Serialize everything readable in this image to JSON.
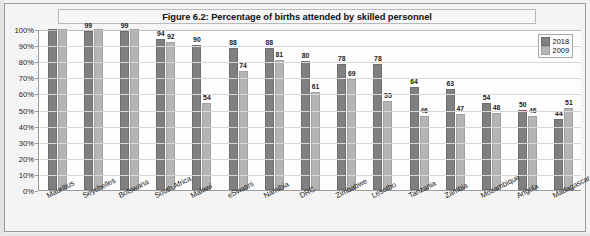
{
  "figure": {
    "title": "Figure 6.2: Percentage of births attended by skilled personnel"
  },
  "legend": {
    "position": "top-right",
    "entries": [
      {
        "label": "2018",
        "color": "#808080"
      },
      {
        "label": "2009",
        "color": "#b5b5b5"
      }
    ]
  },
  "yaxis": {
    "ticks": [
      "0%",
      "10%",
      "20%",
      "30%",
      "40%",
      "50%",
      "60%",
      "70%",
      "80%",
      "90%",
      "100%"
    ]
  },
  "colors": {
    "series_2018": "#808080",
    "series_2009": "#b5b5b5",
    "frame": "#9a9a9a",
    "grid": "#d8d8d8"
  },
  "chart_data": {
    "type": "bar",
    "title": "Figure 6.2: Percentage of births attended by skilled personnel",
    "xlabel": "",
    "ylabel": "",
    "ylim": [
      0,
      100
    ],
    "grid": true,
    "legend_position": "top-right",
    "categories": [
      "Mauritius",
      "Seychelles",
      "Botswana",
      "South Africa",
      "Malawi",
      "eSwatini",
      "Namibia",
      "DRC",
      "Zimbabwe",
      "Lesotho",
      "Tanzania",
      "Zambia",
      "Mozambique",
      "Angola",
      "Madagascar"
    ],
    "series": [
      {
        "name": "2018",
        "color": "#808080",
        "values": [
          100,
          99,
          99,
          94,
          90,
          88,
          88,
          80,
          78,
          78,
          64,
          63,
          54,
          50,
          44
        ],
        "labels": [
          "",
          "99",
          "99",
          "94",
          "90",
          "88",
          "88",
          "80",
          "78",
          "78",
          "64",
          "63",
          "54",
          "50",
          "44"
        ]
      },
      {
        "name": "2009",
        "color": "#b5b5b5",
        "values": [
          100,
          100,
          100,
          92,
          54,
          74,
          81,
          61,
          69,
          55,
          46,
          47,
          48,
          46,
          51
        ],
        "labels": [
          "",
          "",
          "",
          "92",
          "54",
          "74",
          "81",
          "61",
          "69",
          "55",
          "46",
          "47",
          "48",
          "46",
          "51"
        ]
      }
    ]
  }
}
